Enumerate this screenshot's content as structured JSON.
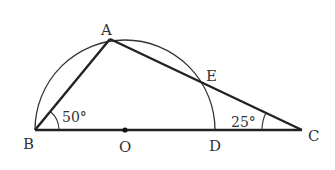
{
  "diagram": {
    "type": "geometry",
    "points": {
      "A": {
        "label": "A"
      },
      "B": {
        "label": "B"
      },
      "C": {
        "label": "C"
      },
      "D": {
        "label": "D"
      },
      "E": {
        "label": "E"
      },
      "O": {
        "label": "O"
      }
    },
    "angles": {
      "ABC": {
        "label": "50°",
        "vertex": "B"
      },
      "ACB": {
        "label": "25°",
        "vertex": "C"
      }
    },
    "segments": [
      "BA",
      "AC",
      "BC"
    ],
    "arc": {
      "center": "O",
      "from": "B",
      "to": "D",
      "kind": "semicircle"
    },
    "colors": {
      "stroke": "#222222",
      "text": "#333333",
      "background": "#ffffff"
    }
  }
}
